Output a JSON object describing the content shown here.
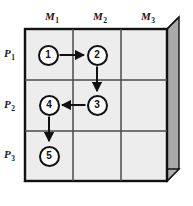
{
  "figure": {
    "type": "matrix-diagram"
  },
  "colors": {
    "cell_fill": "#ededed",
    "grid_line": "#4a4a4a",
    "outer_border": "#111111",
    "extrude_side": "#a9a9a9",
    "extrude_bottom": "#b0b0b0",
    "node_fill": "#ffffff",
    "node_stroke": "#111111",
    "arrow": "#111111",
    "text": "#1a1a1a"
  },
  "columns": [
    {
      "id": "m1",
      "label": "M",
      "sub": "1"
    },
    {
      "id": "m2",
      "label": "M",
      "sub": "2"
    },
    {
      "id": "m3",
      "label": "M",
      "sub": "3"
    }
  ],
  "rows": [
    {
      "id": "p1",
      "label": "P",
      "sub": "1"
    },
    {
      "id": "p2",
      "label": "P",
      "sub": "2"
    },
    {
      "id": "p3",
      "label": "P",
      "sub": "3"
    }
  ],
  "nodes": [
    {
      "id": "n1",
      "label": "1",
      "row": "p1",
      "col": "m1",
      "x": 48,
      "y": 55
    },
    {
      "id": "n2",
      "label": "2",
      "row": "p1",
      "col": "m2",
      "x": 97,
      "y": 55
    },
    {
      "id": "n3",
      "label": "3",
      "row": "p2",
      "col": "m2",
      "x": 97,
      "y": 105
    },
    {
      "id": "n4",
      "label": "4",
      "row": "p2",
      "col": "m1",
      "x": 49,
      "y": 105
    },
    {
      "id": "n5",
      "label": "5",
      "row": "p3",
      "col": "m1",
      "x": 49,
      "y": 156
    }
  ],
  "edges": [
    {
      "id": "e1",
      "from": "n1",
      "to": "n2",
      "direction": "right"
    },
    {
      "id": "e2",
      "from": "n2",
      "to": "n3",
      "direction": "down"
    },
    {
      "id": "e3",
      "from": "n3",
      "to": "n4",
      "direction": "left"
    },
    {
      "id": "e4",
      "from": "n4",
      "to": "n5",
      "direction": "down"
    }
  ],
  "geometry": {
    "grid_left": 25,
    "grid_top": 29,
    "grid_right": 167,
    "grid_bottom": 181,
    "col_dividers": [
      73,
      121
    ],
    "row_dividers": [
      80,
      131
    ],
    "depth": 12
  }
}
